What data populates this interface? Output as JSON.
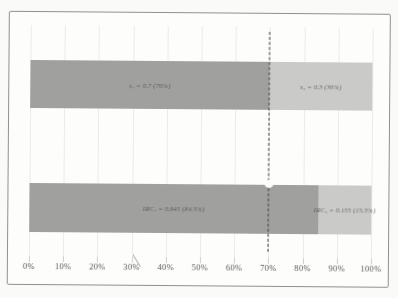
{
  "figure": {
    "background": "#fafaf9",
    "frame_border_color": "#8f8f8d",
    "title": ""
  },
  "chart_data": {
    "type": "bar",
    "orientation": "horizontal",
    "stacked": true,
    "title": "",
    "xlabel": "",
    "ylabel": "",
    "xlim": [
      0,
      1
    ],
    "x_ticks": [
      "0%",
      "10%",
      "20%",
      "30%",
      "40%",
      "50%",
      "60%",
      "70%",
      "80%",
      "90%",
      "100%"
    ],
    "grid": true,
    "legend": "none",
    "categories": [
      "s",
      "IRC"
    ],
    "series": [
      {
        "name": "component-1",
        "color": "#a0a09e",
        "values": [
          0.7,
          0.845
        ]
      },
      {
        "name": "component-2",
        "color": "#cacac8",
        "values": [
          0.3,
          0.155
        ]
      }
    ],
    "bars": [
      {
        "name": "shares",
        "segments": [
          {
            "label": "s₁ = 0.7 (70%)",
            "value": 0.7,
            "color": "#a0a09e"
          },
          {
            "label": "s₂ = 0.3 (30%)",
            "value": 0.3,
            "color": "#cacac8"
          }
        ]
      },
      {
        "name": "incremental-risk-contributions",
        "segments": [
          {
            "label": "IRC₁ = 0.845 (84.5%)",
            "value": 0.845,
            "color": "#a0a09e"
          },
          {
            "label": "IRC₂ = 0.155 (15.5%)",
            "value": 0.155,
            "color": "#cacac8"
          }
        ]
      }
    ],
    "reference_line": {
      "x": 0.7,
      "style": "dashed",
      "color": "#3e3e3c"
    }
  }
}
